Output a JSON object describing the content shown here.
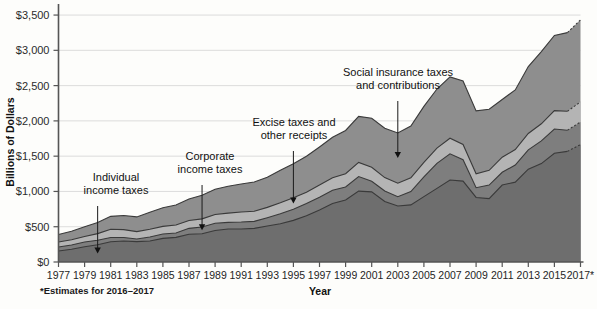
{
  "chart_data": {
    "type": "area",
    "stacked": true,
    "title": "",
    "xlabel": "Year",
    "ylabel": "Billions of Dollars",
    "ylim": [
      0,
      3600
    ],
    "yticks": [
      0,
      500,
      1000,
      1500,
      2000,
      2500,
      3000,
      3500
    ],
    "ytick_labels": [
      "$0",
      "$500",
      "$1,000",
      "$1,500",
      "$2,000",
      "$2,500",
      "$3,000",
      "$3,500"
    ],
    "grid": true,
    "legend_position": "inline-annotations",
    "x": [
      1977,
      1978,
      1979,
      1980,
      1981,
      1982,
      1983,
      1984,
      1985,
      1986,
      1987,
      1988,
      1989,
      1990,
      1991,
      1992,
      1993,
      1994,
      1995,
      1996,
      1997,
      1998,
      1999,
      2000,
      2001,
      2002,
      2003,
      2004,
      2005,
      2006,
      2007,
      2008,
      2009,
      2010,
      2011,
      2012,
      2013,
      2014,
      2015,
      2016,
      2017
    ],
    "xtick_labels": [
      "1977",
      "1979",
      "1981",
      "1983",
      "1985",
      "1987",
      "1989",
      "1991",
      "1993",
      "1995",
      "1997",
      "1999",
      "2001",
      "2003",
      "2005",
      "2007",
      "2009",
      "2011",
      "2013",
      "2015",
      "2017*"
    ],
    "xtick_years": [
      1977,
      1979,
      1981,
      1983,
      1985,
      1987,
      1989,
      1991,
      1993,
      1995,
      1997,
      1999,
      2001,
      2003,
      2005,
      2007,
      2009,
      2011,
      2013,
      2015,
      2017
    ],
    "estimate_years": [
      2016,
      2017
    ],
    "series": [
      {
        "name": "Individual income taxes",
        "color": "#6e6e6e",
        "values": [
          157,
          181,
          217,
          244,
          286,
          298,
          289,
          298,
          335,
          349,
          393,
          401,
          446,
          467,
          468,
          476,
          510,
          543,
          590,
          656,
          737,
          829,
          879,
          1004,
          994,
          858,
          794,
          809,
          927,
          1044,
          1163,
          1146,
          915,
          899,
          1091,
          1132,
          1316,
          1395,
          1541,
          1568,
          1664
        ]
      },
      {
        "name": "Corporate income taxes",
        "color": "#7e7e7e",
        "values": [
          55,
          60,
          66,
          65,
          61,
          49,
          37,
          57,
          61,
          63,
          84,
          95,
          103,
          94,
          98,
          100,
          118,
          140,
          157,
          172,
          182,
          189,
          185,
          207,
          151,
          148,
          132,
          189,
          278,
          354,
          370,
          304,
          138,
          191,
          181,
          242,
          274,
          321,
          344,
          300,
          320
        ]
      },
      {
        "name": "Excise taxes and other receipts",
        "color": "#b4b4b4",
        "values": [
          71,
          75,
          79,
          93,
          118,
          112,
          104,
          110,
          109,
          113,
          112,
          115,
          124,
          132,
          143,
          144,
          146,
          156,
          163,
          162,
          172,
          177,
          188,
          200,
          198,
          190,
          190,
          196,
          207,
          216,
          221,
          216,
          198,
          210,
          213,
          220,
          232,
          243,
          260,
          268,
          286
        ]
      },
      {
        "name": "Social insurance taxes and contributions",
        "color": "#8e8e8e",
        "values": [
          106,
          121,
          138,
          158,
          182,
          201,
          209,
          239,
          265,
          283,
          303,
          334,
          359,
          380,
          396,
          414,
          428,
          461,
          484,
          509,
          539,
          572,
          612,
          653,
          694,
          701,
          713,
          733,
          794,
          838,
          870,
          900,
          891,
          865,
          819,
          845,
          948,
          1023,
          1065,
          1115,
          1162
        ]
      }
    ],
    "annotations": [
      {
        "label_line1": "Individual",
        "label_line2": "income taxes",
        "target_year": 1980,
        "target_band": "Individual income taxes"
      },
      {
        "label_line1": "Corporate",
        "label_line2": "income taxes",
        "target_year": 1988,
        "target_band": "Corporate income taxes"
      },
      {
        "label_line1": "Excise taxes and",
        "label_line2": "other receipts",
        "target_year": 1995,
        "target_band": "Excise taxes and other receipts"
      },
      {
        "label_line1": "Social insurance taxes",
        "label_line2": "and contributions",
        "target_year": 2003,
        "target_band": "Social insurance taxes and contributions"
      }
    ],
    "footnote": "*Estimates for 2016–2017"
  },
  "axes": {
    "y_axis_title": "Billions of Dollars",
    "x_axis_title": "Year"
  },
  "colors": {
    "background": "#fdfdfb",
    "grid": "#d8d8d8",
    "axis": "#555555",
    "band_individual": "#6e6e6e",
    "band_corporate": "#7e7e7e",
    "band_excise": "#b4b4b4",
    "band_social": "#8e8e8e",
    "text": "#111111"
  }
}
